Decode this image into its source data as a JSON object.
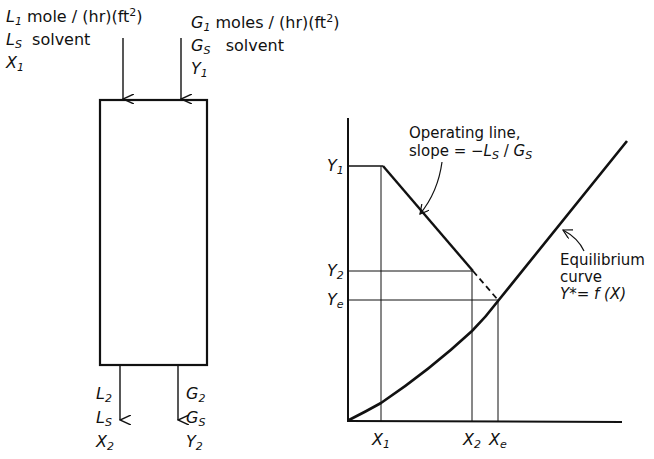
{
  "column": {
    "top_left": {
      "line1_symbol": "L",
      "line1_sub": "1",
      "line1_text": "mole / (hr)(ft",
      "line1_sup": "2",
      "line1_close": ")",
      "line2_symbol": "L",
      "line2_sub": "S",
      "line2_text": "solvent",
      "line3_symbol": "X",
      "line3_sub": "1"
    },
    "top_right": {
      "line1_symbol": "G",
      "line1_sub": "1",
      "line1_text": "moles / (hr)(ft",
      "line1_sup": "2",
      "line1_close": ")",
      "line2_symbol": "G",
      "line2_sub": "S",
      "line2_text": "solvent",
      "line3_symbol": "Y",
      "line3_sub": "1"
    },
    "bottom_left": {
      "line1_symbol": "L",
      "line1_sub": "2",
      "line2_symbol": "L",
      "line2_sub": "S",
      "line3_symbol": "X",
      "line3_sub": "2"
    },
    "bottom_right": {
      "line1_symbol": "G",
      "line1_sub": "2",
      "line2_symbol": "G",
      "line2_sub": "S",
      "line3_symbol": "Y",
      "line3_sub": "2"
    }
  },
  "graph": {
    "y_ticks": [
      {
        "symbol": "Y",
        "sub": "1"
      },
      {
        "symbol": "Y",
        "sub": "2"
      },
      {
        "symbol": "Y",
        "sub": "e"
      }
    ],
    "x_ticks": [
      {
        "symbol": "X",
        "sub": "1"
      },
      {
        "symbol": "X",
        "sub": "2"
      },
      {
        "symbol": "X",
        "sub": "e"
      }
    ],
    "operating_label_line1": "Operating line,",
    "operating_label_line2": "slope = −",
    "operating_slope_num": "L",
    "operating_slope_num_sub": "S",
    "operating_slope_den": "G",
    "operating_slope_den_sub": "S",
    "equilibrium_label_line1": "Equilibrium",
    "equilibrium_label_line2": "curve",
    "equilibrium_label_line3": "Y*= f (X)"
  }
}
